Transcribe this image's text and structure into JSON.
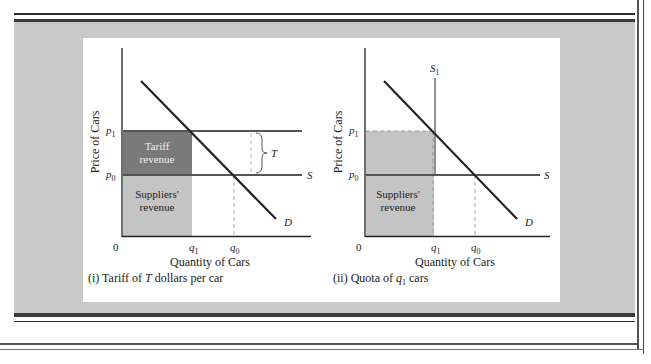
{
  "figure": {
    "panels": [
      {
        "id": "tariff",
        "caption_prefix": "(i) Tariff of ",
        "caption_var": "T",
        "caption_suffix": " dollars per car",
        "y_axis_label": "Price of Cars",
        "x_axis_label": "Quantity of Cars",
        "origin_label": "0",
        "price_labels": {
          "p1": "p",
          "p1_sub": "1",
          "p0": "p",
          "p0_sub": "0"
        },
        "quantity_labels": {
          "q1": "q",
          "q1_sub": "1",
          "q0": "q",
          "q0_sub": "0"
        },
        "curve_labels": {
          "supply": "S",
          "demand": "D",
          "tariff_brace": "T"
        },
        "regions": {
          "tariff_revenue_line1": "Tariff",
          "tariff_revenue_line2": "revenue",
          "suppliers_revenue_line1": "Suppliers'",
          "suppliers_revenue_line2": "revenue"
        }
      },
      {
        "id": "quota",
        "caption_prefix": "(ii) Quota of ",
        "caption_var": "q",
        "caption_var_sub": "1",
        "caption_suffix": " cars",
        "y_axis_label": "Price of Cars",
        "x_axis_label": "Quantity of Cars",
        "origin_label": "0",
        "price_labels": {
          "p1": "p",
          "p1_sub": "1",
          "p0": "p",
          "p0_sub": "0"
        },
        "quantity_labels": {
          "q1": "q",
          "q1_sub": "1",
          "q0": "q",
          "q0_sub": "0"
        },
        "curve_labels": {
          "supply": "S",
          "demand": "D",
          "quota_supply": "S",
          "quota_supply_sub": "1"
        },
        "regions": {
          "suppliers_revenue_line1": "Suppliers'",
          "suppliers_revenue_line2": "revenue"
        }
      }
    ],
    "colors": {
      "panel_bg": "#c9c9c9",
      "tariff_fill": "#7a7a7a",
      "suppliers_fill": "#c4c4c4",
      "quota_fill": "#c4c4c4",
      "line": "#2b2b2b",
      "gridline": "#555555"
    }
  }
}
